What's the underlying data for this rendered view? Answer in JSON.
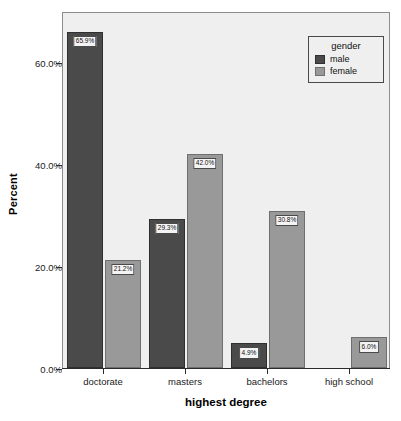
{
  "chart_data": {
    "type": "bar",
    "title": "",
    "xlabel": "highest degree",
    "ylabel": "Percent",
    "categories": [
      "doctorate",
      "masters",
      "bachelors",
      "high school"
    ],
    "series": [
      {
        "name": "male",
        "color": "#4a4a4a",
        "values": [
          65.9,
          29.3,
          4.9,
          0.0
        ],
        "labels": [
          "65.9%",
          "29.3%",
          "4.9%",
          ""
        ]
      },
      {
        "name": "female",
        "color": "#999999",
        "values": [
          21.2,
          42.0,
          30.8,
          6.0
        ],
        "labels": [
          "21.2%",
          "42.0%",
          "30.8%",
          "6.0%"
        ]
      }
    ],
    "ylim": [
      0,
      70
    ],
    "yticks": [
      0,
      20,
      40,
      60
    ],
    "ytick_labels": [
      "0.0%",
      "20.0%",
      "40.0%",
      "60.0%"
    ],
    "grid": false,
    "legend": {
      "title": "gender",
      "position": "top-right",
      "entries": [
        "male",
        "female"
      ]
    },
    "plot_background": "#efefef"
  }
}
